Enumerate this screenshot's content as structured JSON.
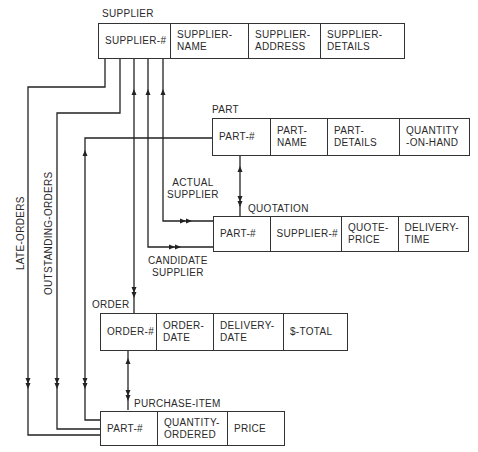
{
  "entities": {
    "supplier": {
      "title": "SUPPLIER",
      "fields": [
        "SUPPLIER-#",
        "SUPPLIER-\nNAME",
        "SUPPLIER-\nADDRESS",
        "SUPPLIER-\nDETAILS"
      ]
    },
    "part": {
      "title": "PART",
      "fields": [
        "PART-#",
        "PART-\nNAME",
        "PART-\nDETAILS",
        "QUANTITY\n-ON-HAND"
      ]
    },
    "quotation": {
      "title": "QUOTATION",
      "fields": [
        "PART-#",
        "SUPPLIER-#",
        "QUOTE-\nPRICE",
        "DELIVERY-\nTIME"
      ]
    },
    "order": {
      "title": "ORDER",
      "fields": [
        "ORDER-#",
        "ORDER-\nDATE",
        "DELIVERY-\nDATE",
        "$-TOTAL"
      ]
    },
    "purchase_item": {
      "title": "PURCHASE-ITEM",
      "fields": [
        "PART-#",
        "QUANTITY-\nORDERED",
        "PRICE"
      ]
    }
  },
  "relationships": {
    "actual_supplier": "ACTUAL\nSUPPLIER",
    "candidate_supplier": "CANDIDATE\nSUPPLIER",
    "late_orders": "LATE-ORDERS",
    "outstanding_orders": "OUTSTANDING-ORDERS"
  }
}
